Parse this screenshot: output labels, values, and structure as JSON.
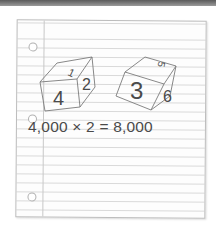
{
  "illustration": {
    "description": "Lined notebook paper with two sketched dice and a multiplication equation",
    "die_left": {
      "top": "1",
      "front": "4",
      "side": "2"
    },
    "die_right": {
      "top": "5",
      "front": "3",
      "side": "6"
    },
    "equation": "4,000 × 2 = 8,000"
  },
  "colors": {
    "ink": "#4a4a4a",
    "rule_lines": "#d9d9d9",
    "top_bar": "#6e6e6e"
  }
}
